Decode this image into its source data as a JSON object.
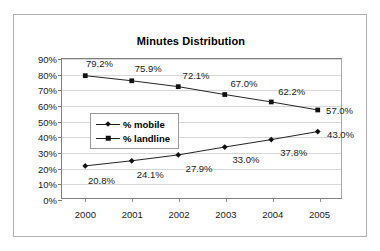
{
  "chart_data": {
    "type": "line",
    "title": "Minutes Distribution",
    "xlabel": "",
    "ylabel": "",
    "categories": [
      "2000",
      "2001",
      "2002",
      "2003",
      "2004",
      "2005"
    ],
    "ylim": [
      0,
      90
    ],
    "ytick_labels": [
      "0%",
      "10%",
      "20%",
      "30%",
      "40%",
      "50%",
      "60%",
      "70%",
      "80%",
      "90%"
    ],
    "ytick_values": [
      0,
      10,
      20,
      30,
      40,
      50,
      60,
      70,
      80,
      90
    ],
    "grid": true,
    "legend_position": "center-left-inside",
    "series": [
      {
        "name": "% mobile",
        "marker": "diamond",
        "values": [
          20.8,
          24.1,
          27.9,
          33.0,
          37.8,
          43.0
        ],
        "data_labels": [
          "20.8%",
          "24.1%",
          "27.9%",
          "33.0%",
          "37.8%",
          "43.0%"
        ]
      },
      {
        "name": "% landline",
        "marker": "square",
        "values": [
          79.2,
          75.9,
          72.1,
          67.0,
          62.2,
          57.0
        ],
        "data_labels": [
          "79.2%",
          "75.9%",
          "72.1%",
          "67.0%",
          "62.2%",
          "57.0%"
        ]
      }
    ],
    "colors": {
      "series_line": "#222222",
      "marker": "#111111",
      "grid": "#d8d8d8",
      "axis": "#808080",
      "frame": "#b0b0b0",
      "text": "#1a1a1a"
    }
  },
  "legend": {
    "items": [
      {
        "label": "% mobile",
        "marker": "diamond"
      },
      {
        "label": "% landline",
        "marker": "square"
      }
    ]
  }
}
